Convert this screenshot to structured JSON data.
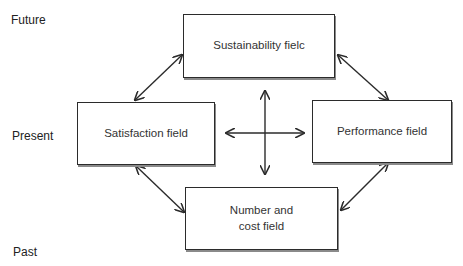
{
  "time_axis": {
    "future": "Future",
    "present": "Present",
    "past": "Past"
  },
  "boxes": {
    "top": {
      "label": "Sustainability fielc"
    },
    "left": {
      "label": "Satisfaction field"
    },
    "right": {
      "label": "Performance field"
    },
    "bottom": {
      "label_line1": "Number and",
      "label_line2": "cost field"
    }
  },
  "connectors": [
    {
      "from": "Sustainability field",
      "to": "Satisfaction field",
      "type": "bidirectional"
    },
    {
      "from": "Sustainability field",
      "to": "Performance field",
      "type": "bidirectional"
    },
    {
      "from": "Satisfaction field",
      "to": "Number and cost field",
      "type": "bidirectional"
    },
    {
      "from": "Performance field",
      "to": "Number and cost field",
      "type": "bidirectional"
    },
    {
      "from": "center",
      "to": "all directions",
      "type": "four-way cross"
    }
  ],
  "colors": {
    "line": "#2b2b2b",
    "shadow": "#8a8a8a",
    "text": "#333333"
  }
}
